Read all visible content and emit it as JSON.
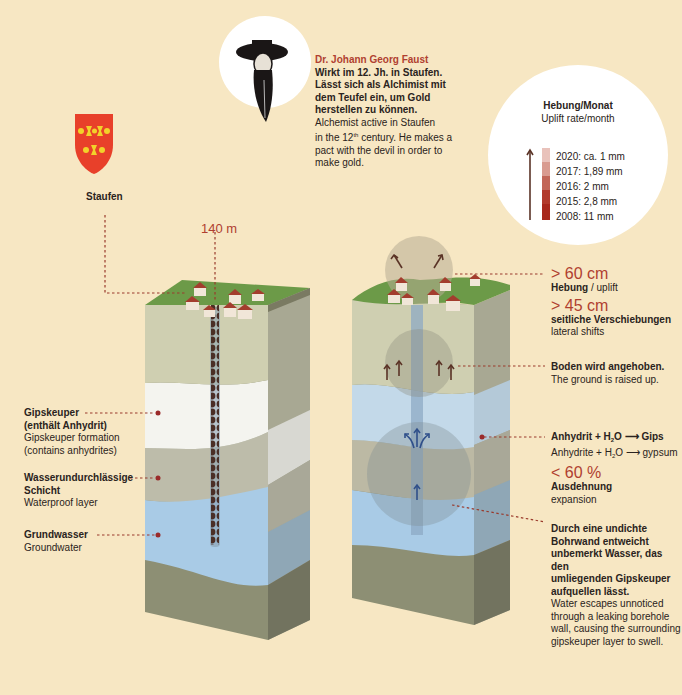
{
  "faust": {
    "name": "Dr. Johann Georg Faust",
    "de_lines": [
      "Wirkt im 12. Jh. in Staufen.",
      "Lässt sich als Alchimist mit",
      "dem Teufel ein, um Gold",
      "herstellen zu können."
    ],
    "en_line1": "Alchemist active in Staufen",
    "en_line2_pre": "in the 12",
    "en_line2_sup": "th",
    "en_line2_post": " century. He makes a",
    "en_line3": "pact with the devil in order to",
    "en_line4": "make gold.",
    "icon": "faust-portrait-icon"
  },
  "town": {
    "name": "Staufen",
    "icon": "coat-of-arms-icon",
    "colors": {
      "shield": "#e8402a",
      "charges": "#f2d22a"
    }
  },
  "uplift_rate": {
    "title_de": "Hebung/Monat",
    "title_en": "Uplift rate/month",
    "entries": [
      {
        "label": "2020: ca. 1 mm",
        "color": "#e9c2bb"
      },
      {
        "label": "2017: 1,89 mm",
        "color": "#d99b90"
      },
      {
        "label": "2016: 2 mm",
        "color": "#c26658"
      },
      {
        "label": "2015: 2,8 mm",
        "color": "#b23a2c"
      },
      {
        "label": "2008: 11 mm",
        "color": "#a8281c"
      }
    ]
  },
  "borehole": {
    "depth_label": "140 m"
  },
  "left_labels": [
    {
      "de1": "Gipskeuper",
      "de2": "(enthält Anhydrit)",
      "en1": "Gipskeuper formation",
      "en2": "(contains anhydrites)"
    },
    {
      "de1": "Wasserundurchlässige",
      "de2": "Schicht",
      "en1": "Waterproof layer",
      "en2": ""
    },
    {
      "de1": "Grundwasser",
      "de2": "",
      "en1": "Groundwater",
      "en2": ""
    }
  ],
  "right_labels": {
    "uplift_value": "> 60 cm",
    "uplift_de": "Hebung",
    "uplift_sep": " / ",
    "uplift_en": "uplift",
    "lateral_value": "> 45 cm",
    "lateral_de": "seitliche Verschiebungen",
    "lateral_en": "lateral shifts",
    "ground_de": "Boden wird angehoben.",
    "ground_en": "The ground is raised up.",
    "reaction_de_a": "Anhydrit + H",
    "reaction_de_sub": "2",
    "reaction_de_b": "O ⟶ Gips",
    "reaction_en_a": "Anhydrite + H",
    "reaction_en_sub": "2",
    "reaction_en_b": "O ⟶ gypsum",
    "expansion_value": "< 60 %",
    "expansion_de": "Ausdehnung",
    "expansion_en": "expansion",
    "leak_de": [
      "Durch eine undichte",
      "Bohrwand entweicht",
      "unbemerkt Wasser, das den",
      "umliegenden Gipskeuper",
      "aufquellen lässt."
    ],
    "leak_en": [
      "Water escapes unnoticed",
      "through a leaking borehole",
      "wall, causing the surrounding",
      "gipskeuper layer to swell."
    ]
  },
  "colors": {
    "background": "#f7e7c3",
    "grass": "#6c9a48",
    "topsoil": "#cfcfb1",
    "gipskeuper": "#f4f4ef",
    "waterproof": "#bdbcaa",
    "groundwater": "#a9cbe6",
    "bedrock": "#8d8f74",
    "accent_red": "#b04030"
  }
}
